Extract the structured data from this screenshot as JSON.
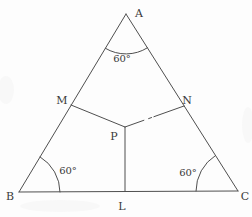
{
  "diagram": {
    "background_color": "#fdfdfd",
    "stroke_color": "#4f4f4f",
    "label_color": "#3a3a3a",
    "points": {
      "A": [
        126,
        14
      ],
      "B": [
        19,
        192
      ],
      "C": [
        238,
        191
      ],
      "M": [
        71,
        105
      ],
      "N": [
        184,
        106
      ],
      "P": [
        125,
        127
      ],
      "L": [
        125,
        191
      ]
    },
    "segments": [
      {
        "name": "side-AB",
        "from": "A",
        "to": "B"
      },
      {
        "name": "side-AC",
        "from": "A",
        "to": "C"
      },
      {
        "name": "side-BC",
        "from": "B",
        "to": "C"
      },
      {
        "name": "segment-MP",
        "from": "M",
        "to": "P"
      },
      {
        "name": "segment-PN",
        "from": "P",
        "to": "N",
        "gap": true
      },
      {
        "name": "segment-PL",
        "from": "P",
        "to": "L"
      }
    ],
    "angle_arcs": [
      {
        "name": "angle-arc-A",
        "path": "M 105.4 48.3 A 40 40 0 0 0 147.4 47.8"
      },
      {
        "name": "angle-arc-B",
        "path": "M 40.1 156.9 A 41 41 0 0 1 60 192"
      },
      {
        "name": "angle-arc-C",
        "path": "M 196 191 A 42 42 0 0 1 215.5 155.5"
      }
    ],
    "vertex_labels": [
      {
        "name": "label-A",
        "text": "A",
        "x": 139,
        "y": 17
      },
      {
        "name": "label-B",
        "text": "B",
        "x": 10,
        "y": 200
      },
      {
        "name": "label-C",
        "text": "C",
        "x": 245,
        "y": 200
      },
      {
        "name": "label-M",
        "text": "M",
        "x": 62,
        "y": 104,
        "size": 12
      },
      {
        "name": "label-N",
        "text": "N",
        "x": 187,
        "y": 104
      },
      {
        "name": "label-P",
        "text": "P",
        "x": 114,
        "y": 140
      },
      {
        "name": "label-L",
        "text": "L",
        "x": 122,
        "y": 210
      }
    ],
    "angle_labels": [
      {
        "name": "angle-label-A",
        "text": "60°",
        "x": 122,
        "y": 62
      },
      {
        "name": "angle-label-B",
        "text": "60°",
        "x": 68,
        "y": 174
      },
      {
        "name": "angle-label-C",
        "text": "60°",
        "x": 188,
        "y": 176
      }
    ],
    "scan_smudges": [
      {
        "cx": 6,
        "cy": 90,
        "rx": 8,
        "ry": 14
      },
      {
        "cx": 60,
        "cy": 206,
        "rx": 40,
        "ry": 6
      },
      {
        "cx": 248,
        "cy": 125,
        "rx": 6,
        "ry": 18
      }
    ]
  }
}
